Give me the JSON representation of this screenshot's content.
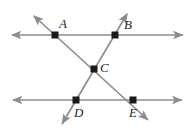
{
  "figure": {
    "kind": "geometry-diagram",
    "background_color": "#ffffff",
    "line_color": "#8c8c8c",
    "point_color": "#1a1a1a",
    "label_color": "#231f20",
    "width": 194,
    "height": 130
  },
  "labels": {
    "a": "A",
    "b": "B",
    "c": "C",
    "d": "D",
    "e": "E"
  },
  "points": [
    {
      "name": "A",
      "x": 55,
      "y": 35
    },
    {
      "name": "B",
      "x": 115,
      "y": 35
    },
    {
      "name": "C",
      "x": 94,
      "y": 69
    },
    {
      "name": "D",
      "x": 76,
      "y": 100
    },
    {
      "name": "E",
      "x": 133,
      "y": 100
    }
  ],
  "label_positions": [
    {
      "name": "A",
      "x": 59,
      "y": 17
    },
    {
      "name": "B",
      "x": 124,
      "y": 18
    },
    {
      "name": "C",
      "x": 100,
      "y": 61
    },
    {
      "name": "D",
      "x": 74,
      "y": 106
    },
    {
      "name": "E",
      "x": 129,
      "y": 106
    }
  ],
  "lines": [
    {
      "name": "top-parallel-line",
      "x1": 12,
      "y1": 35,
      "x2": 183,
      "y2": 35,
      "arrow_start": true,
      "arrow_end": true
    },
    {
      "name": "bottom-parallel-line",
      "x1": 13,
      "y1": 100,
      "x2": 182,
      "y2": 100,
      "arrow_start": true,
      "arrow_end": true
    },
    {
      "name": "transversal-a-c-e",
      "x1": 34,
      "y1": 16,
      "x2": 148,
      "y2": 120,
      "arrow_start": true,
      "arrow_end": true
    },
    {
      "name": "transversal-b-c-d",
      "x1": 127,
      "y1": 14,
      "x2": 62,
      "y2": 124,
      "arrow_start": true,
      "arrow_end": true
    }
  ]
}
